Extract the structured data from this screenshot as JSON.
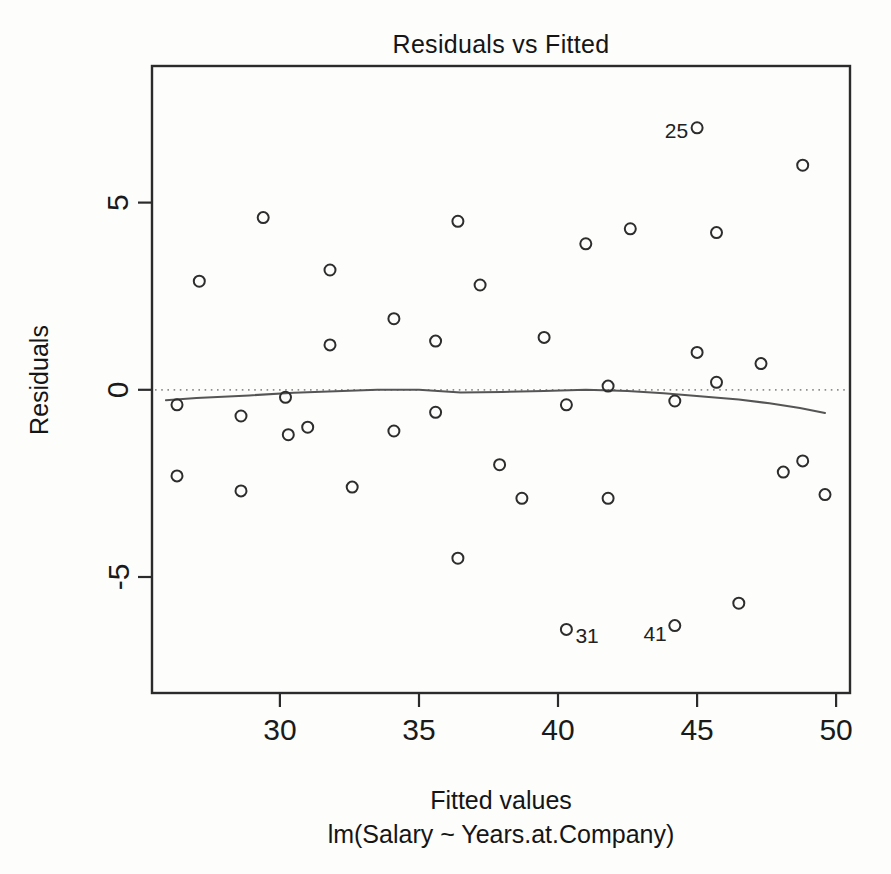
{
  "page": {
    "background_color": "#fdfdfc",
    "text_color": "#1a1a1a"
  },
  "chart_data": {
    "type": "scatter",
    "title": "Residuals vs Fitted",
    "xlabel": "Fitted values",
    "xlabel_sub": "lm(Salary ~ Years.at.Company)",
    "ylabel": "Residuals",
    "xlim": [
      25.4,
      50.5
    ],
    "ylim": [
      -8.1,
      8.65
    ],
    "xticks": [
      30,
      35,
      40,
      45,
      50
    ],
    "yticks": [
      -5,
      0,
      5
    ],
    "grid": false,
    "legend": null,
    "axis_color": "#2b2b2b",
    "text_color": "#1a1a1a",
    "point_style": {
      "shape": "open-circle",
      "color": "#2d2d2d",
      "radius": 5.5,
      "stroke_width": 2
    },
    "points": [
      [
        26.3,
        -0.4
      ],
      [
        26.3,
        -2.3
      ],
      [
        27.1,
        2.9
      ],
      [
        28.6,
        -0.7
      ],
      [
        28.6,
        -2.7
      ],
      [
        29.4,
        4.6
      ],
      [
        30.2,
        -0.2
      ],
      [
        30.3,
        -1.2
      ],
      [
        31.0,
        -1.0
      ],
      [
        31.8,
        3.2
      ],
      [
        31.8,
        1.2
      ],
      [
        32.6,
        -2.6
      ],
      [
        34.1,
        1.9
      ],
      [
        34.1,
        -1.1
      ],
      [
        35.6,
        1.3
      ],
      [
        35.6,
        -0.6
      ],
      [
        36.4,
        4.5
      ],
      [
        36.4,
        -4.5
      ],
      [
        37.2,
        2.8
      ],
      [
        37.9,
        -2.0
      ],
      [
        38.7,
        -2.9
      ],
      [
        39.5,
        1.4
      ],
      [
        40.3,
        -0.4
      ],
      [
        40.3,
        -6.4
      ],
      [
        41.0,
        3.9
      ],
      [
        41.8,
        0.1
      ],
      [
        41.8,
        -2.9
      ],
      [
        42.6,
        4.3
      ],
      [
        44.2,
        -0.3
      ],
      [
        44.2,
        -6.3
      ],
      [
        45.0,
        7.0
      ],
      [
        45.0,
        1.0
      ],
      [
        45.7,
        4.2
      ],
      [
        45.7,
        0.2
      ],
      [
        46.5,
        -5.7
      ],
      [
        47.3,
        0.7
      ],
      [
        48.1,
        -2.2
      ],
      [
        48.8,
        6.0
      ],
      [
        48.8,
        -1.9
      ],
      [
        49.6,
        -2.8
      ]
    ],
    "labeled_points": [
      {
        "label": "25",
        "x": 45.0,
        "y": 7.0,
        "side": "left",
        "dx": -9,
        "dy": 10
      },
      {
        "label": "31",
        "x": 40.3,
        "y": -6.4,
        "side": "right",
        "dx": 9,
        "dy": 14
      },
      {
        "label": "41",
        "x": 44.2,
        "y": -6.3,
        "side": "left",
        "dx": -8,
        "dy": 15
      }
    ],
    "reference_line": {
      "y": 0,
      "style": "dotted",
      "color": "#8f8f8f"
    },
    "smooth_line": {
      "name": "lowess",
      "color": "#555555",
      "width": 2,
      "points": [
        [
          25.9,
          -0.28
        ],
        [
          27.0,
          -0.22
        ],
        [
          28.9,
          -0.15
        ],
        [
          30.5,
          -0.08
        ],
        [
          32.0,
          -0.04
        ],
        [
          33.5,
          0.0
        ],
        [
          35.0,
          0.0
        ],
        [
          36.5,
          -0.07
        ],
        [
          38.0,
          -0.06
        ],
        [
          39.5,
          -0.03
        ],
        [
          41.0,
          0.0
        ],
        [
          42.5,
          -0.03
        ],
        [
          43.8,
          -0.09
        ],
        [
          45.1,
          -0.17
        ],
        [
          46.5,
          -0.26
        ],
        [
          47.6,
          -0.36
        ],
        [
          48.7,
          -0.49
        ],
        [
          49.6,
          -0.62
        ]
      ]
    }
  }
}
